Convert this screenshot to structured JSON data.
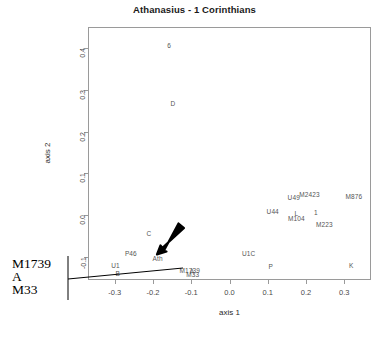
{
  "chart_data": {
    "type": "scatter",
    "title": "Athanasius - 1 Corinthians",
    "xlabel": "axis 1",
    "ylabel": "axis 2",
    "xlim": [
      -0.37,
      0.37
    ],
    "ylim": [
      -0.155,
      0.45
    ],
    "xticks": [
      "-0.3",
      "-0.2",
      "-0.1",
      "0.0",
      "0.1",
      "0.2",
      "0.3"
    ],
    "xtick_values": [
      -0.3,
      -0.2,
      -0.1,
      0.0,
      0.1,
      0.2,
      0.3
    ],
    "yticks": [
      "0.4",
      "0.3",
      "0.2",
      "0.1",
      "0.0",
      "-0.1"
    ],
    "ytick_values": [
      0.4,
      0.3,
      0.2,
      0.1,
      0.0,
      -0.1
    ],
    "grid": false,
    "legend": null,
    "marker_style": "text-label-only",
    "points": [
      {
        "label": "6",
        "x": -0.158,
        "y": 0.408
      },
      {
        "label": "D",
        "x": -0.148,
        "y": 0.268
      },
      {
        "label": "U49",
        "x": 0.168,
        "y": 0.043
      },
      {
        "label": "M2423",
        "x": 0.209,
        "y": 0.051
      },
      {
        "label": "M876",
        "x": 0.325,
        "y": 0.047
      },
      {
        "label": "U44",
        "x": 0.113,
        "y": 0.011
      },
      {
        "label": "L",
        "x": 0.175,
        "y": 0.006
      },
      {
        "label": "M104",
        "x": 0.175,
        "y": -0.007
      },
      {
        "label": "1",
        "x": 0.226,
        "y": 0.008
      },
      {
        "label": "M223",
        "x": 0.248,
        "y": -0.022
      },
      {
        "label": "C",
        "x": -0.211,
        "y": -0.043
      },
      {
        "label": "P46",
        "x": -0.258,
        "y": -0.09
      },
      {
        "label": "Ath",
        "x": -0.188,
        "y": -0.103
      },
      {
        "label": "U1C",
        "x": 0.05,
        "y": -0.091
      },
      {
        "label": "P",
        "x": 0.108,
        "y": -0.121
      },
      {
        "label": "K",
        "x": 0.318,
        "y": -0.118
      },
      {
        "label": "U1",
        "x": -0.298,
        "y": -0.12
      },
      {
        "label": "B",
        "x": -0.292,
        "y": -0.138
      },
      {
        "label": "M1739",
        "x": -0.104,
        "y": -0.131
      },
      {
        "label": "A",
        "x": -0.098,
        "y": -0.134
      },
      {
        "label": "M33",
        "x": -0.096,
        "y": -0.141
      }
    ],
    "annotations": [
      {
        "type": "arrow",
        "name": "highlight-arrow",
        "target_label": "Ath",
        "description": "bold black arrow pointing down-left toward Ath"
      },
      {
        "type": "callout",
        "name": "overlap-callout",
        "lines": [
          "M1739",
          "A",
          "M33"
        ],
        "description": "leader line from left margin bracket to overlapping cluster"
      }
    ]
  }
}
